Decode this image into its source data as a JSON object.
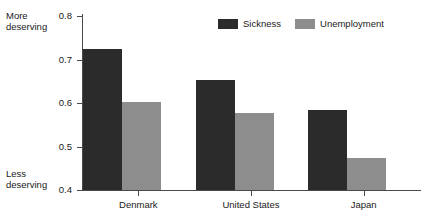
{
  "chart_data": {
    "type": "bar",
    "title": "",
    "xlabel": "",
    "ylabel": "",
    "categories": [
      "Denmark",
      "United States",
      "Japan"
    ],
    "series": [
      {
        "name": "Sickness",
        "color": "#2b2b2b",
        "values": [
          0.725,
          0.653,
          0.583
        ]
      },
      {
        "name": "Unemployment",
        "color": "#8d8d8d",
        "values": [
          0.602,
          0.577,
          0.474
        ]
      }
    ],
    "ylim": [
      0.4,
      0.8
    ],
    "yticks": [
      0.4,
      0.5,
      0.6,
      0.7,
      0.8
    ],
    "ytick_labels": [
      "0.4",
      "0.5",
      "0.6",
      "0.7",
      "0.8"
    ],
    "grid": false,
    "legend_position": "top-center",
    "annotations": [
      {
        "name": "axis-top-note",
        "text_line1": "More",
        "text_line2": "deserving",
        "position": "top-left"
      },
      {
        "name": "axis-bottom-note",
        "text_line1": "Less",
        "text_line2": "deserving",
        "position": "bottom-left"
      }
    ]
  },
  "axis_notes": {
    "more_line1": "More",
    "more_line2": "deserving",
    "less_line1": "Less",
    "less_line2": "deserving"
  },
  "y_axis": {
    "labels": [
      "0.8",
      "0.7",
      "0.6",
      "0.5",
      "0.4"
    ]
  },
  "x_axis": {
    "labels": [
      "Denmark",
      "United States",
      "Japan"
    ]
  },
  "legend": {
    "items": [
      {
        "label": "Sickness",
        "color": "#2b2b2b"
      },
      {
        "label": "Unemployment",
        "color": "#8d8d8d"
      }
    ]
  },
  "colors": {
    "sickness": "#2b2b2b",
    "unemployment": "#8d8d8d",
    "axis": "#4a4a4a",
    "text": "#1a1a1a",
    "background": "#ffffff"
  }
}
